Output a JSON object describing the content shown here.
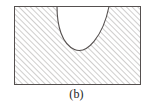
{
  "figure": {
    "caption": "(b)",
    "title": "",
    "kind": "hatched-region-with-concave-notch",
    "colors": {
      "outline": "#55504f",
      "hatch": "#8d8a89",
      "background": "#ffffff",
      "caption_text": "#201d1d"
    },
    "rectangle": {
      "x": 14,
      "y": 6,
      "width": 127,
      "height": 79,
      "stroke_width": 1
    },
    "notch": {
      "shape": "u-curve",
      "description": "rounded U-shaped unhatched notch opening upward at the top edge",
      "left_x_at_top": 57,
      "right_x_at_top": 109,
      "bottom_y": 50,
      "top_y": 6
    },
    "hatching": {
      "angle_deg": 45,
      "direction": "lower-left-to-upper-right",
      "spacing_px": 4,
      "line_width": 0.8
    }
  }
}
